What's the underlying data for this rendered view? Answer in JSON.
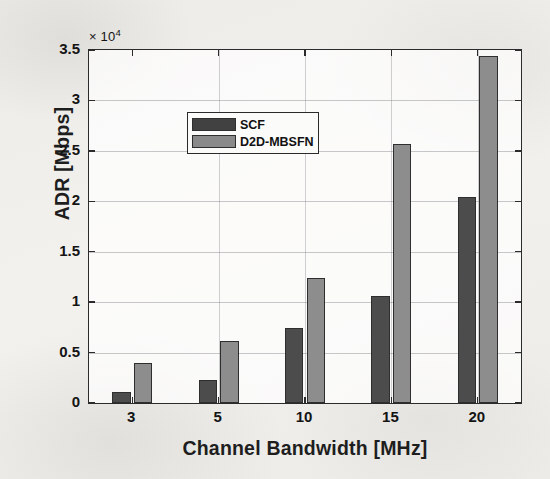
{
  "chart_data": {
    "type": "bar",
    "title": "",
    "subtitle": "",
    "xlabel": "Channel Bandwidth [MHz]",
    "ylabel": "ADR [Mbps]",
    "exponent_label": "× 10",
    "exponent_power": "4",
    "y_scale_factor": 10000,
    "categories": [
      "3",
      "5",
      "10",
      "15",
      "20"
    ],
    "series": [
      {
        "name": "SCF",
        "color": "#4c4c4c",
        "values": [
          1100,
          2300,
          7400,
          10600,
          20400
        ]
      },
      {
        "name": "D2D-MBSFN",
        "color": "#8d8d8d",
        "values": [
          4000,
          6100,
          12400,
          25700,
          34400
        ]
      }
    ],
    "ylim": [
      0,
      35000
    ],
    "yticks": [
      0,
      5000,
      10000,
      15000,
      20000,
      25000,
      30000,
      35000
    ],
    "ytick_labels": [
      "0",
      "0.5",
      "1",
      "1.5",
      "2",
      "2.5",
      "3",
      "3.5"
    ],
    "xtick_labels": [
      "3",
      "5",
      "10",
      "15",
      "20"
    ],
    "grid": true,
    "legend_position": "top-left",
    "legend_entries": [
      "SCF",
      "D2D-MBSFN"
    ]
  },
  "figure": {
    "background_color": "#f2f1ee",
    "axes_color": "#2b2b2b",
    "grid_color": "#787879"
  }
}
